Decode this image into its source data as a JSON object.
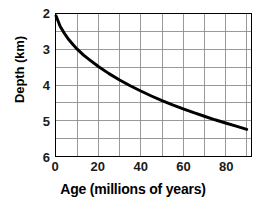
{
  "chart_data": {
    "type": "line",
    "title": "",
    "xlabel": "Age (millions of years)",
    "ylabel": "Depth (km)",
    "xlim": [
      0,
      92
    ],
    "ylim": [
      6,
      2
    ],
    "y_axis_inverted": true,
    "grid": true,
    "legend": null,
    "x_major_ticks": [
      0,
      20,
      40,
      60,
      80
    ],
    "x_tick_labels": [
      "0",
      "20",
      "40",
      "60",
      "80"
    ],
    "x_gridlines": [
      10,
      20,
      30,
      40,
      50,
      60,
      70,
      80,
      90
    ],
    "y_major_ticks": [
      2,
      3,
      4,
      5,
      6
    ],
    "y_tick_labels": [
      "2",
      "3",
      "4",
      "5",
      "6"
    ],
    "y_gridlines": [
      2.5,
      3,
      3.5,
      4,
      4.5,
      5,
      5.5
    ],
    "series": [
      {
        "name": "ocean floor depth",
        "color": "#000000",
        "line_width": 3,
        "x": [
          0,
          2,
          4,
          6,
          8,
          10,
          13,
          16,
          20,
          25,
          30,
          35,
          40,
          45,
          50,
          55,
          60,
          65,
          70,
          75,
          80,
          85,
          90
        ],
        "y": [
          2.05,
          2.35,
          2.55,
          2.72,
          2.86,
          2.99,
          3.16,
          3.3,
          3.48,
          3.68,
          3.86,
          4.02,
          4.17,
          4.31,
          4.44,
          4.56,
          4.67,
          4.78,
          4.88,
          4.98,
          5.07,
          5.16,
          5.25
        ]
      }
    ]
  },
  "axes": {
    "y_title": "Depth (km)",
    "x_title": "Age (millions of years)"
  },
  "colors": {
    "curve": "#000000",
    "grid": "#8c8c8c",
    "frame": "#000000",
    "text": "#000000",
    "background": "#ffffff"
  }
}
